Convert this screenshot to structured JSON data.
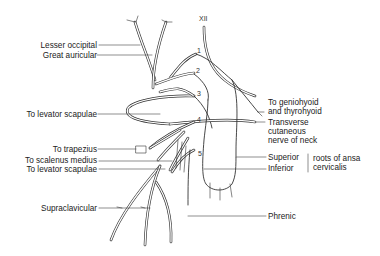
{
  "diagram": {
    "colors": {
      "line": "#333333",
      "background": "#ffffff",
      "text": "#222222"
    },
    "left_labels": [
      {
        "id": "lesser-occipital",
        "text": "Lesser occipital"
      },
      {
        "id": "great-auricular",
        "text": "Great auricular"
      },
      {
        "id": "to-levator-scapulae-upper",
        "text": "To levator scapulae"
      },
      {
        "id": "to-trapezius",
        "text": "To trapezius"
      },
      {
        "id": "to-scalenus-medius",
        "text": "To scalenus medius"
      },
      {
        "id": "to-levator-scapulae-lower",
        "text": "To levator scapulae"
      },
      {
        "id": "supraclavicular",
        "text": "Supraclavicular"
      }
    ],
    "right_labels": [
      {
        "id": "to-geniohyoid",
        "line1": "To geniohyoid",
        "line2": "and thyrohyoid"
      },
      {
        "id": "transverse-cutaneous",
        "line1": "Transverse",
        "line2": "cutaneous",
        "line3": "nerve of neck"
      },
      {
        "id": "superior-root",
        "text": "Superior"
      },
      {
        "id": "inferior-root",
        "text": "Inferior"
      },
      {
        "id": "ansa-group",
        "line1": "roots of ansa",
        "line2": "cervicalis"
      },
      {
        "id": "phrenic",
        "text": "Phrenic"
      }
    ],
    "cranial_nerve": {
      "label": "XII"
    },
    "root_numbers": [
      "1",
      "2",
      "3",
      "4",
      "5"
    ]
  }
}
